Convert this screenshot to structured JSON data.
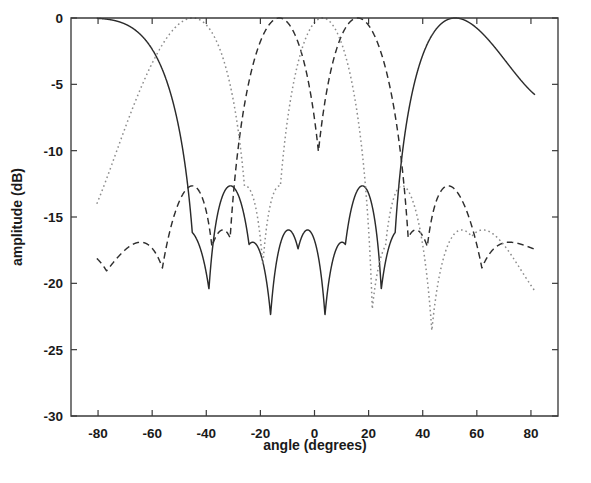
{
  "figure": {
    "background_color": "#ffffff",
    "plot_box": {
      "left": 71,
      "top": 18,
      "right": 558,
      "bottom": 416
    }
  },
  "chart_data": {
    "type": "line",
    "title": "",
    "subtitle": "",
    "xlabel": "angle (degrees)",
    "ylabel": "amplitude (dB)",
    "xlim": [
      -90,
      90
    ],
    "ylim": [
      -30,
      0
    ],
    "xticks": [
      -80,
      -60,
      -40,
      -20,
      0,
      20,
      40,
      60,
      80
    ],
    "xticklabels": [
      "-80",
      "-60",
      "-40",
      "-20",
      "0",
      "20",
      "40",
      "60",
      "80"
    ],
    "yticks": [
      -30,
      -25,
      -20,
      -15,
      -10,
      -5,
      0
    ],
    "yticklabels": [
      "-30",
      "-25",
      "-20",
      "-15",
      "-10",
      "-5",
      "0"
    ],
    "grid": false,
    "legend": null,
    "legend_position": "none",
    "annotations": [],
    "series": [
      {
        "name": "beam-solid",
        "style": "solid",
        "color": "#2b2b2b",
        "main_lobe_peaks_deg": [
          -90,
          52
        ],
        "nulls_deg": [
          -50,
          -14,
          15.5
        ],
        "sidelobe_peaks": [
          {
            "angle_deg": -30,
            "value_db": -11.4
          },
          {
            "angle_deg": 2,
            "value_db": -11.4
          }
        ],
        "edge_values": [
          {
            "angle_deg": -79,
            "value_db": -4.3
          },
          {
            "angle_deg": 81,
            "value_db": -3.0
          }
        ]
      },
      {
        "name": "beam-dashed",
        "style": "dashed",
        "color": "#2e2e2e",
        "main_lobe_peaks_deg": [
          -13,
          16
        ],
        "nulls_deg": [
          -47,
          -14.5,
          48,
          52
        ],
        "sidelobe_peaks": [
          {
            "angle_deg": -30,
            "value_db": -11.6
          },
          {
            "angle_deg": 31,
            "value_db": -11.5
          },
          {
            "angle_deg": 80,
            "value_db": -11.8
          }
        ],
        "edge_values": [
          {
            "angle_deg": -79,
            "value_db": -11.5
          },
          {
            "angle_deg": 81,
            "value_db": -11.8
          }
        ]
      },
      {
        "name": "beam-dotted",
        "style": "dotted",
        "color": "#8c8c8c",
        "main_lobe_peaks_deg": [
          -45,
          3
        ],
        "nulls_deg": [
          -13,
          15,
          50
        ],
        "sidelobe_peaks": [
          {
            "angle_deg": -30,
            "value_db": -11.9
          },
          {
            "angle_deg": 30,
            "value_db": -11.7
          }
        ],
        "edge_values": [
          {
            "angle_deg": -79,
            "value_db": -3.6
          },
          {
            "angle_deg": 81,
            "value_db": -5.2
          }
        ]
      }
    ]
  }
}
